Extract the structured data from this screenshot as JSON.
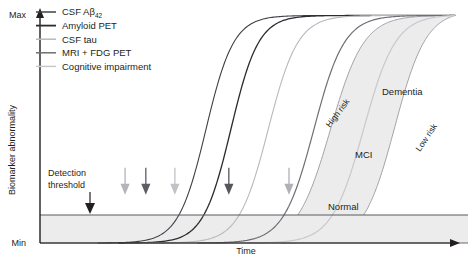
{
  "chart_data": {
    "type": "line",
    "title": "",
    "xlabel": "Time",
    "ylabel": "Biomarker abnormality",
    "y_tick_labels": [
      "Max",
      "Min"
    ],
    "x_tick_labels": [],
    "grid": false,
    "legend_position": "top-left",
    "axis_style": "arrow",
    "series": [
      {
        "name": "CSF Aβ42",
        "color": "#3f3f46",
        "width": 1.1,
        "onset_x": 0.16,
        "threshold_cross_x": 0.205,
        "midpoint_x": 0.4,
        "steepness": 7.5
      },
      {
        "name": "Amyloid PET",
        "color": "#2b2b30",
        "width": 1.3,
        "onset_x": 0.21,
        "threshold_cross_x": 0.255,
        "midpoint_x": 0.46,
        "steepness": 7.5
      },
      {
        "name": "CSF tau",
        "color": "#b9b9bd",
        "width": 1.1,
        "onset_x": 0.26,
        "threshold_cross_x": 0.325,
        "midpoint_x": 0.55,
        "steepness": 7.0
      },
      {
        "name": "MRI + FDG PET",
        "color": "#6e6e75",
        "width": 1.2,
        "onset_x": 0.4,
        "threshold_cross_x": 0.455,
        "midpoint_x": 0.66,
        "steepness": 6.8
      },
      {
        "name": "Cognitive impairment",
        "color": "#c9c9cd",
        "width": 1.2,
        "onset_x": 0.52,
        "threshold_cross_x": 0.6,
        "midpoint_x": 0.78,
        "steepness": 6.5
      }
    ],
    "threshold": {
      "label_line1": "Detection",
      "label_line2": "threshold",
      "y_value": 0.205,
      "line_color": "#5a5a5f"
    },
    "threshold_arrows": [
      {
        "series": "CSF Aβ42",
        "x": 0.205,
        "color": "#b5b5b9"
      },
      {
        "series": "Amyloid PET",
        "x": 0.255,
        "color": "#5d5d63"
      },
      {
        "series": "CSF tau",
        "x": 0.325,
        "color": "#c2c2c6"
      },
      {
        "series": "MRI + FDG PET",
        "x": 0.455,
        "color": "#55555b"
      },
      {
        "series": "Cognitive impairment",
        "x": 0.6,
        "color": "#b0b0b5"
      }
    ],
    "detection_arrow": {
      "x": 0.18,
      "color": "#231f20"
    },
    "cognitive_band": {
      "fill": "#ececed",
      "edge_color": "#9a9a9f",
      "zones": [
        {
          "label": "Normal",
          "x": 0.695,
          "y": 0.235
        },
        {
          "label": "MCI",
          "x": 0.785,
          "y": 0.4
        },
        {
          "label": "Dementia",
          "x": 0.835,
          "y": 0.645
        }
      ],
      "boundaries": [
        {
          "label": "High risk",
          "rotation": -53
        },
        {
          "label": "Low risk",
          "rotation": -56
        }
      ]
    }
  },
  "legend": {
    "items": [
      {
        "label_main": "CSF Aβ",
        "label_sub": "42",
        "swatch": "#3f3f46"
      },
      {
        "label_main": "Amyloid PET",
        "label_sub": "",
        "swatch": "#2b2b30"
      },
      {
        "label_main": "CSF tau",
        "label_sub": "",
        "swatch": "#b9b9bd"
      },
      {
        "label_main": "MRI + FDG PET",
        "label_sub": "",
        "swatch": "#6e6e75"
      },
      {
        "label_main": "Cognitive impairment",
        "label_sub": "",
        "swatch": "#c9c9cd"
      }
    ]
  },
  "axes": {
    "y_label": "Biomarker abnormality",
    "y_max_label": "Max",
    "y_min_label": "Min",
    "x_label": "Time"
  },
  "annotations": {
    "detection_line1": "Detection",
    "detection_line2": "threshold",
    "normal": "Normal",
    "mci": "MCI",
    "dementia": "Dementia",
    "high_risk": "High risk",
    "low_risk": "Low risk"
  }
}
